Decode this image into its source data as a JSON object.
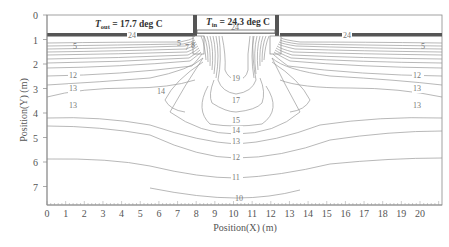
{
  "chart_data": {
    "type": "contour",
    "title": "",
    "xlabel": "Position(X) (m)",
    "ylabel": "Position(Y) (m)",
    "xlim": [
      0,
      21
    ],
    "ylim": [
      8,
      0
    ],
    "x_ticks": [
      "0",
      "1",
      "2",
      "3",
      "4",
      "5",
      "6",
      "7",
      "8",
      "9",
      "10",
      "11",
      "12",
      "13",
      "14",
      "15",
      "16",
      "17",
      "18",
      "19",
      "20"
    ],
    "y_ticks": [
      "0",
      "1",
      "2",
      "3",
      "4",
      "5",
      "6",
      "7"
    ],
    "annotations": {
      "t_out": {
        "symbol": "T",
        "subscript": "out",
        "text": " = 17.7 deg C"
      },
      "t_in": {
        "symbol": "T",
        "subscript": "in",
        "text": " = 24.3 deg C"
      }
    },
    "contour_labels": [
      {
        "value": "24",
        "x": 4.5,
        "y": 0.85
      },
      {
        "value": "24",
        "x": 10.3,
        "y": 0.2
      },
      {
        "value": "24",
        "x": 15.5,
        "y": 0.85
      },
      {
        "value": "5",
        "x": 1.5,
        "y": 1.3
      },
      {
        "value": "5",
        "x": 7.5,
        "y": 1.2
      },
      {
        "value": "7",
        "x": 7.8,
        "y": 1.3
      },
      {
        "value": "8",
        "x": 8.1,
        "y": 1.25
      },
      {
        "value": "5",
        "x": 20.0,
        "y": 1.3
      },
      {
        "value": "12",
        "x": 1.5,
        "y": 2.55
      },
      {
        "value": "12",
        "x": 20.0,
        "y": 2.55
      },
      {
        "value": "13",
        "x": 1.5,
        "y": 3.05
      },
      {
        "value": "13",
        "x": 20.0,
        "y": 3.05
      },
      {
        "value": "13",
        "x": 1.5,
        "y": 3.9
      },
      {
        "value": "13",
        "x": 20.0,
        "y": 3.9
      },
      {
        "value": "14",
        "x": 5.8,
        "y": 3.1
      },
      {
        "value": "19",
        "x": 10.2,
        "y": 2.6
      },
      {
        "value": "17",
        "x": 10.2,
        "y": 3.4
      },
      {
        "value": "15",
        "x": 10.2,
        "y": 4.15
      },
      {
        "value": "14",
        "x": 10.2,
        "y": 4.55
      },
      {
        "value": "13",
        "x": 10.2,
        "y": 5.0
      },
      {
        "value": "12",
        "x": 10.2,
        "y": 5.65
      },
      {
        "value": "11",
        "x": 10.2,
        "y": 6.45
      },
      {
        "value": "10",
        "x": 10.2,
        "y": 7.55
      }
    ],
    "levels": [
      5,
      7,
      8,
      10,
      11,
      12,
      13,
      14,
      15,
      17,
      19,
      24
    ],
    "grid": false,
    "legend": null
  }
}
